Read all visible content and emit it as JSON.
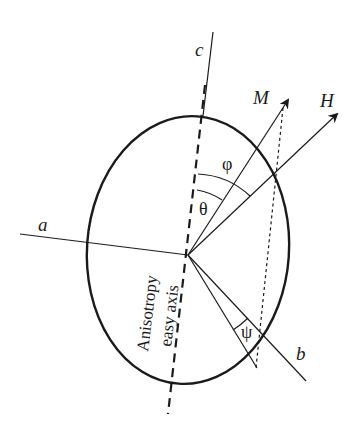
{
  "figure": {
    "type": "magnetic particle anisotropy diagram",
    "axes": {
      "c": "c",
      "a": "a",
      "b": "b"
    },
    "vectors": {
      "M": "M",
      "H": "H"
    },
    "angles": {
      "phi": "φ",
      "theta": "θ",
      "psi": "ψ"
    },
    "easy_axis_label": {
      "line1": "Anisotropy",
      "line2": "easy axis"
    },
    "colors": {
      "ink": "#1a1a1a",
      "background": "#ffffff"
    }
  }
}
